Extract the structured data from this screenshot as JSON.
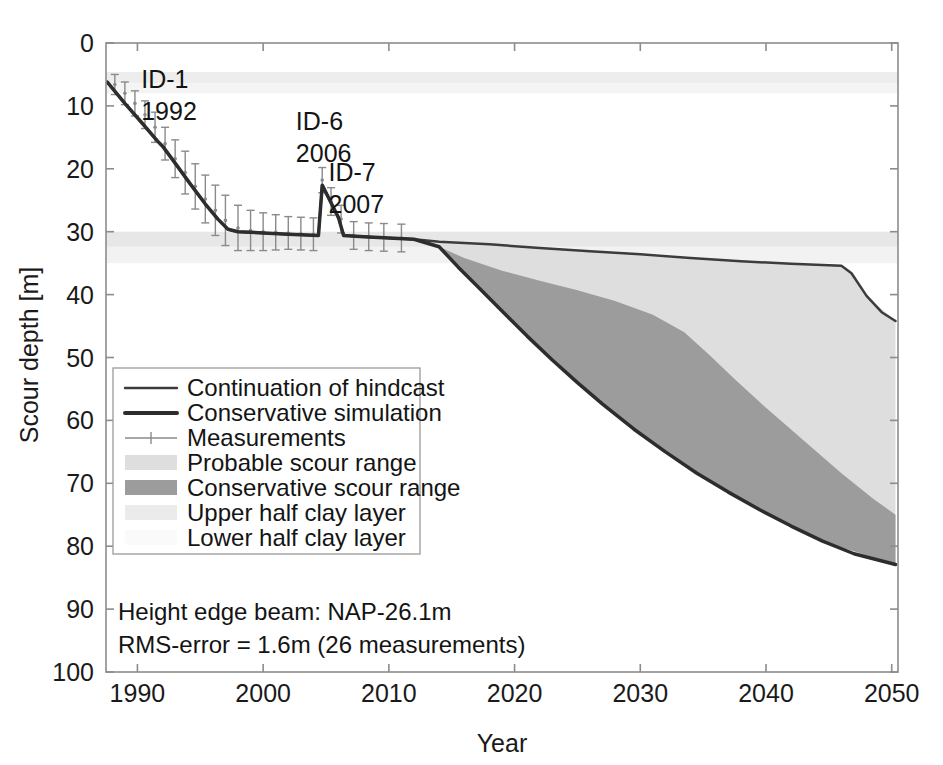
{
  "chart_data": {
    "type": "area",
    "title": "",
    "xlabel": "Year",
    "ylabel": "Scour depth [m]",
    "xlim": [
      1987.5,
      2050.5
    ],
    "ylim": [
      0,
      100
    ],
    "y_inverted": true,
    "grid": false,
    "xticks": [
      1990,
      2000,
      2010,
      2020,
      2030,
      2040,
      2050
    ],
    "xtick_labels": [
      "1990",
      "2000",
      "2010",
      "2020",
      "2030",
      "2040",
      "2050"
    ],
    "yticks": [
      0,
      10,
      20,
      30,
      40,
      50,
      60,
      70,
      80,
      90,
      100
    ],
    "ytick_labels": [
      "0",
      "10",
      "20",
      "30",
      "40",
      "50",
      "60",
      "70",
      "80",
      "90",
      "100"
    ],
    "legend_position": "center-left",
    "series": [
      {
        "name": "Continuation of hindcast",
        "type": "line",
        "color": "#3c3c3c",
        "width": 2.5,
        "points": [
          [
            1987.6,
            6.2
          ],
          [
            1989.0,
            9.6
          ],
          [
            1990.4,
            12.8
          ],
          [
            1991.6,
            15.6
          ],
          [
            1992.0,
            16.4
          ],
          [
            1993.0,
            19.1
          ],
          [
            1994.2,
            22.4
          ],
          [
            1995.4,
            25.6
          ],
          [
            1996.4,
            28.0
          ],
          [
            1997.2,
            29.6
          ],
          [
            1998.0,
            30.0
          ],
          [
            2000.0,
            30.2
          ],
          [
            2002.0,
            30.4
          ],
          [
            2004.4,
            30.6
          ],
          [
            2004.7,
            22.6
          ],
          [
            2005.4,
            25.4
          ],
          [
            2006.0,
            27.8
          ],
          [
            2006.4,
            30.6
          ],
          [
            2008.0,
            30.8
          ],
          [
            2010.0,
            31.0
          ],
          [
            2012.0,
            31.2
          ],
          [
            2014.0,
            31.6
          ],
          [
            2018.0,
            32.0
          ],
          [
            2022.0,
            32.6
          ],
          [
            2026.0,
            33.1
          ],
          [
            2030.0,
            33.6
          ],
          [
            2034.0,
            34.2
          ],
          [
            2038.0,
            34.7
          ],
          [
            2042.0,
            35.1
          ],
          [
            2046.0,
            35.4
          ],
          [
            2046.8,
            36.6
          ],
          [
            2048.0,
            40.2
          ],
          [
            2049.2,
            42.8
          ],
          [
            2050.3,
            44.2
          ]
        ]
      },
      {
        "name": "Conservative simulation",
        "type": "line",
        "color": "#2d2d2d",
        "width": 3.5,
        "points": [
          [
            1987.6,
            6.2
          ],
          [
            1989.0,
            9.6
          ],
          [
            1990.4,
            12.8
          ],
          [
            1991.6,
            15.6
          ],
          [
            1992.0,
            16.4
          ],
          [
            1993.0,
            19.1
          ],
          [
            1994.2,
            22.4
          ],
          [
            1995.4,
            25.6
          ],
          [
            1996.4,
            28.0
          ],
          [
            1997.2,
            29.6
          ],
          [
            1998.0,
            30.0
          ],
          [
            2000.0,
            30.2
          ],
          [
            2002.0,
            30.4
          ],
          [
            2004.4,
            30.6
          ],
          [
            2004.7,
            22.6
          ],
          [
            2005.4,
            25.4
          ],
          [
            2006.0,
            27.8
          ],
          [
            2006.4,
            30.6
          ],
          [
            2008.0,
            30.8
          ],
          [
            2010.0,
            31.0
          ],
          [
            2012.0,
            31.2
          ],
          [
            2014.0,
            32.4
          ],
          [
            2015.5,
            35.6
          ],
          [
            2017.0,
            38.6
          ],
          [
            2019.0,
            42.6
          ],
          [
            2021.0,
            46.6
          ],
          [
            2023.0,
            50.4
          ],
          [
            2025.0,
            54.0
          ],
          [
            2027.0,
            57.4
          ],
          [
            2029.5,
            61.4
          ],
          [
            2032.0,
            65.0
          ],
          [
            2034.5,
            68.4
          ],
          [
            2037.0,
            71.4
          ],
          [
            2039.5,
            74.2
          ],
          [
            2042.0,
            76.8
          ],
          [
            2044.5,
            79.2
          ],
          [
            2047.0,
            81.2
          ],
          [
            2050.3,
            82.9
          ]
        ]
      }
    ],
    "bands": [
      {
        "name": "Probable scour range",
        "color": "#dedede",
        "upper": [
          [
            2014.0,
            31.6
          ],
          [
            2018.0,
            32.0
          ],
          [
            2022.0,
            32.6
          ],
          [
            2026.0,
            33.1
          ],
          [
            2030.0,
            33.6
          ],
          [
            2034.0,
            34.2
          ],
          [
            2038.0,
            34.7
          ],
          [
            2042.0,
            35.1
          ],
          [
            2046.0,
            35.4
          ],
          [
            2046.8,
            36.6
          ],
          [
            2048.0,
            40.2
          ],
          [
            2050.3,
            44.2
          ]
        ],
        "lower": [
          [
            2014.0,
            32.4
          ],
          [
            2017.0,
            38.6
          ],
          [
            2021.0,
            46.6
          ],
          [
            2025.0,
            54.0
          ],
          [
            2029.5,
            61.4
          ],
          [
            2034.5,
            68.4
          ],
          [
            2039.5,
            74.2
          ],
          [
            2044.5,
            79.2
          ],
          [
            2050.3,
            82.9
          ]
        ]
      },
      {
        "name": "Conservative scour range",
        "color": "#9c9c9c",
        "upper": [
          [
            2014.0,
            32.4
          ],
          [
            2016.0,
            34.2
          ],
          [
            2019.0,
            36.2
          ],
          [
            2022.0,
            37.8
          ],
          [
            2025.0,
            39.3
          ],
          [
            2028.0,
            41.0
          ],
          [
            2031.0,
            43.2
          ],
          [
            2033.5,
            46.0
          ],
          [
            2035.5,
            49.6
          ],
          [
            2037.5,
            53.4
          ],
          [
            2040.0,
            58.0
          ],
          [
            2043.0,
            63.2
          ],
          [
            2046.0,
            68.4
          ],
          [
            2048.5,
            72.4
          ],
          [
            2050.3,
            75.0
          ]
        ],
        "lower": [
          [
            2014.0,
            32.4
          ],
          [
            2017.0,
            38.6
          ],
          [
            2021.0,
            46.6
          ],
          [
            2025.0,
            54.0
          ],
          [
            2029.5,
            61.4
          ],
          [
            2034.5,
            68.4
          ],
          [
            2039.5,
            74.2
          ],
          [
            2044.5,
            79.2
          ],
          [
            2050.3,
            82.9
          ]
        ]
      }
    ],
    "clay_layers": [
      {
        "name": "Upper half clay layer",
        "color": "#ededed",
        "y_top": 4.6,
        "y_bottom": 6.4
      },
      {
        "name": "Lower half clay layer",
        "color": "#f4f4f4",
        "y_top": 6.4,
        "y_bottom": 8.0
      },
      {
        "name": "Upper half clay layer",
        "color": "#e7e7e7",
        "y_top": 30.0,
        "y_bottom": 32.4
      },
      {
        "name": "Lower half clay layer",
        "color": "#f2f2f2",
        "y_top": 32.4,
        "y_bottom": 35.0
      }
    ],
    "measurements": {
      "name": "Measurements",
      "color": "#8a8a8a",
      "errorbar_cap": 4,
      "points": [
        {
          "x": 1988.2,
          "y": 6.6,
          "err": 1.6
        },
        {
          "x": 1989.0,
          "y": 8.0,
          "err": 1.8
        },
        {
          "x": 1989.8,
          "y": 9.6,
          "err": 2.0
        },
        {
          "x": 1990.6,
          "y": 11.4,
          "err": 2.2
        },
        {
          "x": 1991.4,
          "y": 13.4,
          "err": 2.4
        },
        {
          "x": 1992.2,
          "y": 16.0,
          "err": 2.6
        },
        {
          "x": 1993.0,
          "y": 18.4,
          "err": 3.0
        },
        {
          "x": 1993.8,
          "y": 20.6,
          "err": 3.4
        },
        {
          "x": 1994.6,
          "y": 22.8,
          "err": 3.6
        },
        {
          "x": 1995.4,
          "y": 24.8,
          "err": 3.8
        },
        {
          "x": 1996.2,
          "y": 26.6,
          "err": 4.0
        },
        {
          "x": 1997.0,
          "y": 28.2,
          "err": 4.0
        },
        {
          "x": 1998.0,
          "y": 29.4,
          "err": 3.6
        },
        {
          "x": 1999.0,
          "y": 29.8,
          "err": 3.2
        },
        {
          "x": 2000.0,
          "y": 30.0,
          "err": 3.0
        },
        {
          "x": 2001.0,
          "y": 30.1,
          "err": 2.8
        },
        {
          "x": 2002.0,
          "y": 30.2,
          "err": 2.6
        },
        {
          "x": 2003.0,
          "y": 30.3,
          "err": 2.6
        },
        {
          "x": 2004.0,
          "y": 30.4,
          "err": 2.6
        },
        {
          "x": 2004.7,
          "y": 21.8,
          "err": 2.0
        },
        {
          "x": 2005.4,
          "y": 25.2,
          "err": 2.2
        },
        {
          "x": 2006.2,
          "y": 28.0,
          "err": 2.2
        },
        {
          "x": 2007.2,
          "y": 30.6,
          "err": 2.2
        },
        {
          "x": 2008.4,
          "y": 30.8,
          "err": 2.2
        },
        {
          "x": 2009.6,
          "y": 30.9,
          "err": 2.2
        },
        {
          "x": 2011.0,
          "y": 31.0,
          "err": 2.2
        }
      ]
    },
    "annotations": [
      {
        "id": "id1",
        "lines": [
          "ID-1",
          "1992"
        ],
        "x": 1990.3,
        "y": 7.2
      },
      {
        "id": "id6",
        "lines": [
          "ID-6",
          "2006"
        ],
        "x": 2002.6,
        "y": 13.8
      },
      {
        "id": "id7",
        "lines": [
          "ID-7",
          "2007"
        ],
        "x": 2005.2,
        "y": 22.0
      }
    ],
    "notes": [
      "Height edge beam: NAP-26.1m",
      "RMS-error = 1.6m (26 measurements)"
    ]
  },
  "legend": {
    "items": [
      {
        "label": "Continuation of hindcast",
        "swatch": "line-thin",
        "color": "#3c3c3c"
      },
      {
        "label": "Conservative simulation",
        "swatch": "line-thick",
        "color": "#2d2d2d"
      },
      {
        "label": "Measurements",
        "swatch": "errorbar",
        "color": "#8a8a8a"
      },
      {
        "label": "Probable scour range",
        "swatch": "patch",
        "color": "#dedede"
      },
      {
        "label": "Conservative scour range",
        "swatch": "patch",
        "color": "#9c9c9c"
      },
      {
        "label": "Upper half clay layer",
        "swatch": "patch",
        "color": "#ebebeb"
      },
      {
        "label": "Lower half clay layer",
        "swatch": "patch",
        "color": "#fafafa"
      }
    ]
  }
}
